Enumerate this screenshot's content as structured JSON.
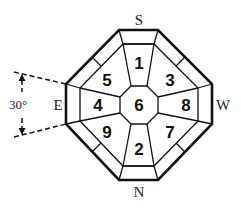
{
  "diagram": {
    "type": "octagonal-layout",
    "directions": {
      "south": "S",
      "north": "N",
      "east": "E",
      "west": "W"
    },
    "angle_label": "30°",
    "sectors": {
      "top": "1",
      "bottom": "2",
      "top_right": "3",
      "left": "4",
      "top_left": "5",
      "center": "6",
      "bottom_right": "7",
      "right": "8",
      "bottom_left": "9"
    },
    "colors": {
      "stroke": "#111111",
      "background": "#ffffff"
    }
  }
}
